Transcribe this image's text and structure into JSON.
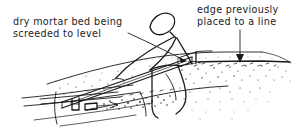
{
  "figure": {
    "style": "hand-drawn technical line illustration",
    "background_color": "#ffffff",
    "ink_color": "#1a1a1a",
    "width": 303,
    "height": 140
  },
  "annotations": {
    "left": {
      "name": "dry-mortar-bed-label",
      "line1": "dry mortar bed being",
      "line2": "screeded to level",
      "x": 13,
      "y": 16
    },
    "right": {
      "name": "edge-previously-placed-label",
      "line1": "edge previously",
      "line2": "placed to a line",
      "x": 197,
      "y": 4
    }
  },
  "leaders": [
    {
      "name": "leader-to-screed-board",
      "from": [
        128,
        33
      ],
      "to": [
        190,
        63
      ],
      "arrowhead": true,
      "description": "leader line from left caption to the screed board"
    },
    {
      "name": "leader-arrow-to-edge",
      "from": [
        240,
        30
      ],
      "to": [
        240,
        62
      ],
      "arrowhead": true,
      "description": "vertical arrow from right caption down to the previously placed edge"
    }
  ],
  "scene_elements": [
    {
      "name": "worker-figure",
      "label": "stick figure worker bent over screeding"
    },
    {
      "name": "screed-board",
      "label": "long straight screed board resting on rails"
    },
    {
      "name": "guide-rail",
      "label": "guide rail / batten on the left"
    },
    {
      "name": "mortar-bed",
      "label": "stippled dry mortar bed"
    },
    {
      "name": "placed-edge",
      "label": "previously placed edge set to a line"
    },
    {
      "name": "slab-substrate",
      "label": "substrate slab lines at lower left"
    }
  ]
}
